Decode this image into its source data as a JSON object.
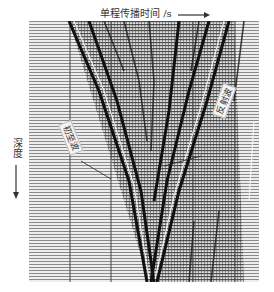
{
  "figure": {
    "x_axis_label": "单程传播时间 /s",
    "x_axis_arrow": "→",
    "y_axis_label": "深度",
    "y_axis_arrow": "↓",
    "annotations": {
      "first_arrival": "初至波",
      "reflected": "反射波"
    },
    "colors": {
      "background": "#ffffff",
      "trace_light": "#e6e6e6",
      "trace_dark": "#1a1a1a",
      "grid_line": "#555555"
    }
  }
}
